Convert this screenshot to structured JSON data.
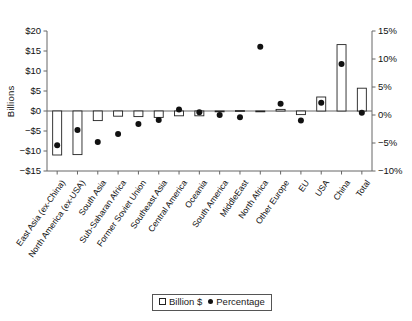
{
  "chart_data": {
    "type": "bar",
    "title": "",
    "xlabel": "",
    "ylabel": "Billions",
    "y2label": "",
    "ylim": [
      -15,
      20
    ],
    "y2lim": [
      -10,
      15
    ],
    "yticks": [
      "$20",
      "$15",
      "$10",
      "$5",
      "$0",
      "−$5",
      "−$10",
      "−$15"
    ],
    "ytick_values": [
      20,
      15,
      10,
      5,
      0,
      -5,
      -10,
      -15
    ],
    "y2ticks": [
      "15%",
      "10%",
      "5%",
      "0%",
      "−5%",
      "−10%"
    ],
    "y2tick_values": [
      15,
      10,
      5,
      0,
      -5,
      -10
    ],
    "grid": false,
    "legend_position": "bottom-center",
    "categories": [
      "East Asia (ex-China)",
      "North America (ex-USA)",
      "South Asia",
      "Sub-Saharan Africa",
      "Former Soviet Union",
      "Southeast Asia",
      "Central America",
      "Oceania",
      "South America",
      "MiddleEast",
      "North Africa",
      "Other Europe",
      "EU",
      "USA",
      "China",
      "Total"
    ],
    "series": [
      {
        "name": "Billion $",
        "axis": "left",
        "marker": "open-square",
        "values": [
          -11.0,
          -10.9,
          -2.4,
          -1.3,
          -1.4,
          -1.6,
          -1.2,
          -1.2,
          -0.2,
          0.1,
          -0.1,
          0.4,
          -0.9,
          3.5,
          16.6,
          5.7
        ]
      },
      {
        "name": "Percentage",
        "axis": "right",
        "marker": "filled-circle",
        "values": [
          -5.4,
          -2.7,
          -4.8,
          -3.4,
          -1.6,
          -0.9,
          1.0,
          0.5,
          0.0,
          -0.4,
          12.2,
          2.0,
          -1.0,
          2.2,
          9.1,
          0.4
        ]
      }
    ]
  },
  "legend": {
    "items": [
      {
        "label": "Billion $",
        "marker": "open-square"
      },
      {
        "label": "Percentage",
        "marker": "filled-circle"
      }
    ]
  },
  "colors": {
    "axis": "#666666",
    "bar_stroke": "#222222",
    "bar_fill": "#ffffff",
    "dot": "#111111",
    "text": "#111111"
  }
}
